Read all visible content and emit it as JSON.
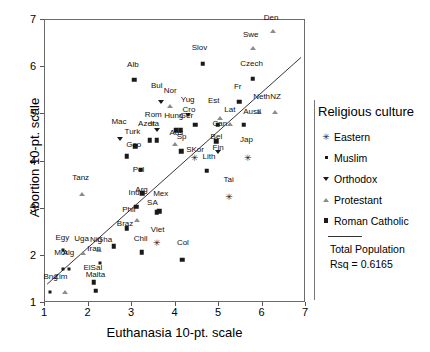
{
  "chart_data": {
    "type": "scatter",
    "title": "",
    "xlabel": "Euthanasia 10-pt. scale",
    "ylabel": "Abortion 10-pt. scale",
    "xlim": [
      1,
      7
    ],
    "ylim": [
      1,
      7
    ],
    "xticks": [
      1,
      2,
      3,
      4,
      5,
      6,
      7
    ],
    "yticks": [
      1,
      2,
      3,
      4,
      5,
      6,
      7
    ],
    "grid": false,
    "legend_position": "right",
    "legend_title": "Religious culture",
    "legend_entries": [
      {
        "label": "Eastern",
        "marker": "star"
      },
      {
        "label": "Muslim",
        "marker": "dot"
      },
      {
        "label": "Orthodox",
        "marker": "triangle-down"
      },
      {
        "label": "Protestant",
        "marker": "triangle-up"
      },
      {
        "label": "Roman Catholic",
        "marker": "square"
      }
    ],
    "fit_line": {
      "label": "Total Population",
      "rsq_label": "Rsq = 0.6165",
      "x0": 1.05,
      "y0": 1.36,
      "x1": 6.93,
      "y1": 6.2
    },
    "points": [
      {
        "label": "Den",
        "x": 6.24,
        "y": 6.77,
        "marker": "triangle-up",
        "lx": 6.2,
        "ly": 6.96
      },
      {
        "label": "Swe",
        "x": 5.78,
        "y": 6.4,
        "marker": "triangle-up",
        "lx": 5.73,
        "ly": 6.59
      },
      {
        "label": "Slov",
        "x": 4.63,
        "y": 6.07,
        "marker": "square",
        "lx": 4.55,
        "ly": 6.32
      },
      {
        "label": "Czech",
        "x": 5.78,
        "y": 5.75,
        "marker": "square",
        "lx": 5.75,
        "ly": 5.99
      },
      {
        "label": "Alb",
        "x": 3.05,
        "y": 5.73,
        "marker": "square",
        "lx": 3.02,
        "ly": 5.97
      },
      {
        "label": "Bul",
        "x": 3.66,
        "y": 5.26,
        "marker": "triangle-down",
        "lx": 3.57,
        "ly": 5.52
      },
      {
        "label": "Nor",
        "x": 3.87,
        "y": 5.17,
        "marker": "triangle-up",
        "lx": 3.88,
        "ly": 5.42
      },
      {
        "label": "Fr",
        "x": 5.46,
        "y": 5.27,
        "marker": "square",
        "lx": 5.43,
        "ly": 5.5
      },
      {
        "label": "Neth",
        "x": 5.93,
        "y": 5.05,
        "marker": "triangle-up",
        "lx": 5.98,
        "ly": 5.29
      },
      {
        "label": "NZ",
        "x": 6.28,
        "y": 5.05,
        "marker": "triangle-up",
        "lx": 6.3,
        "ly": 5.29
      },
      {
        "label": "Yug",
        "x": 4.28,
        "y": 4.98,
        "marker": "triangle-down",
        "lx": 4.28,
        "ly": 5.22
      },
      {
        "label": "Est",
        "x": 5.02,
        "y": 4.93,
        "marker": "triangle-up",
        "lx": 4.88,
        "ly": 5.2
      },
      {
        "label": "Cro",
        "x": 4.45,
        "y": 4.78,
        "marker": "square",
        "lx": 4.31,
        "ly": 5.0
      },
      {
        "label": "Lat",
        "x": 5.25,
        "y": 4.8,
        "marker": "triangle-up",
        "lx": 5.25,
        "ly": 5.01
      },
      {
        "label": "Austl",
        "x": 5.57,
        "y": 4.78,
        "marker": "square",
        "lx": 5.76,
        "ly": 4.97
      },
      {
        "label": "Rom",
        "x": 3.58,
        "y": 4.67,
        "marker": "triangle-down",
        "lx": 3.49,
        "ly": 4.9
      },
      {
        "label": "Hung",
        "x": 4.02,
        "y": 4.66,
        "marker": "square",
        "lx": 3.96,
        "ly": 4.87
      },
      {
        "label": "Ger",
        "x": 4.12,
        "y": 4.66,
        "marker": "square",
        "lx": 4.25,
        "ly": 4.87
      },
      {
        "label": "Can",
        "x": 4.97,
        "y": 4.78,
        "marker": "square",
        "lx": 5.02,
        "ly": 4.72
      },
      {
        "label": "Mac",
        "x": 2.72,
        "y": 4.48,
        "marker": "triangle-down",
        "lx": 2.7,
        "ly": 4.76
      },
      {
        "label": "Azer",
        "x": 3.41,
        "y": 4.45,
        "marker": "square",
        "lx": 3.33,
        "ly": 4.7
      },
      {
        "label": "Ita",
        "x": 3.57,
        "y": 4.45,
        "marker": "square",
        "lx": 3.52,
        "ly": 4.7
      },
      {
        "label": "Turk",
        "x": 3.07,
        "y": 4.32,
        "marker": "square",
        "lx": 3.01,
        "ly": 4.55
      },
      {
        "label": "Aus",
        "x": 3.98,
        "y": 4.37,
        "marker": "triangle-up",
        "lx": 4.02,
        "ly": 4.53
      },
      {
        "label": "Sp",
        "x": 4.13,
        "y": 4.22,
        "marker": "square",
        "lx": 4.14,
        "ly": 4.43
      },
      {
        "label": "Geo",
        "x": 2.88,
        "y": 4.11,
        "marker": "square",
        "lx": 3.04,
        "ly": 4.27
      },
      {
        "label": "Jap",
        "x": 5.66,
        "y": 4.08,
        "marker": "star",
        "lx": 5.63,
        "ly": 4.38
      },
      {
        "label": "Bel",
        "x": 4.94,
        "y": 4.43,
        "marker": "square",
        "lx": 4.94,
        "ly": 4.43
      },
      {
        "label": "Fin",
        "x": 4.98,
        "y": 4.2,
        "marker": "triangle-down",
        "lx": 4.98,
        "ly": 4.2
      },
      {
        "label": "SKor",
        "x": 4.44,
        "y": 4.08,
        "marker": "star",
        "lx": 4.45,
        "ly": 4.15
      },
      {
        "label": "Lith",
        "x": 4.72,
        "y": 3.8,
        "marker": "square",
        "lx": 4.77,
        "ly": 4.02
      },
      {
        "label": "Pol",
        "x": 3.2,
        "y": 3.82,
        "marker": "square",
        "lx": 3.15,
        "ly": 3.74
      },
      {
        "label": "Tanz",
        "x": 1.85,
        "y": 3.32,
        "marker": "triangle-up",
        "lx": 1.82,
        "ly": 3.57
      },
      {
        "label": "Tai",
        "x": 5.23,
        "y": 3.25,
        "marker": "star",
        "lx": 5.22,
        "ly": 3.53
      },
      {
        "label": "Arg",
        "x": 3.23,
        "y": 3.33,
        "marker": "square",
        "lx": 3.22,
        "ly": 3.31
      },
      {
        "label": "Ind",
        "x": 3.1,
        "y": 3.04,
        "marker": "square",
        "lx": 3.05,
        "ly": 3.24
      },
      {
        "label": "Mex",
        "x": 3.63,
        "y": 2.95,
        "marker": "square",
        "lx": 3.66,
        "ly": 3.22
      },
      {
        "label": "SA",
        "x": 3.57,
        "y": 2.92,
        "marker": "square",
        "lx": 3.47,
        "ly": 3.03
      },
      {
        "label": "Phil",
        "x": 3.12,
        "y": 2.75,
        "marker": "triangle-up",
        "lx": 2.93,
        "ly": 2.88
      },
      {
        "label": "Braz",
        "x": 2.88,
        "y": 2.58,
        "marker": "square",
        "lx": 2.84,
        "ly": 2.6
      },
      {
        "label": "Viet",
        "x": 3.57,
        "y": 2.28,
        "marker": "star",
        "lx": 3.59,
        "ly": 2.47
      },
      {
        "label": "Chil",
        "x": 3.22,
        "y": 2.08,
        "marker": "square",
        "lx": 3.2,
        "ly": 2.28
      },
      {
        "label": "Col",
        "x": 4.16,
        "y": 1.92,
        "marker": "square",
        "lx": 4.17,
        "ly": 2.19
      },
      {
        "label": "Egy",
        "x": 1.42,
        "y": 2.12,
        "marker": "dot",
        "lx": 1.4,
        "ly": 2.3
      },
      {
        "label": "Uga",
        "x": 1.87,
        "y": 2.07,
        "marker": "triangle-up",
        "lx": 1.84,
        "ly": 2.28
      },
      {
        "label": "Nig",
        "x": 2.23,
        "y": 2.12,
        "marker": "triangle-up",
        "lx": 2.17,
        "ly": 2.26
      },
      {
        "label": "Gha",
        "x": 2.58,
        "y": 2.2,
        "marker": "square",
        "lx": 2.37,
        "ly": 2.25
      },
      {
        "label": "Iran",
        "x": 2.27,
        "y": 1.84,
        "marker": "dot",
        "lx": 2.13,
        "ly": 2.07
      },
      {
        "label": "Mor",
        "x": 1.41,
        "y": 1.73,
        "marker": "dot",
        "lx": 1.37,
        "ly": 1.98
      },
      {
        "label": "Alg",
        "x": 1.56,
        "y": 1.73,
        "marker": "dot",
        "lx": 1.54,
        "ly": 1.98
      },
      {
        "label": "ElSal",
        "x": 2.12,
        "y": 1.44,
        "marker": "square",
        "lx": 2.1,
        "ly": 1.66
      },
      {
        "label": "Malta",
        "x": 2.17,
        "y": 1.26,
        "marker": "square",
        "lx": 2.16,
        "ly": 1.5
      },
      {
        "label": "Bng",
        "x": 1.12,
        "y": 1.24,
        "marker": "dot",
        "lx": 1.13,
        "ly": 1.47
      },
      {
        "label": "Zim",
        "x": 1.47,
        "y": 1.24,
        "marker": "triangle-up",
        "lx": 1.36,
        "ly": 1.47
      }
    ]
  }
}
